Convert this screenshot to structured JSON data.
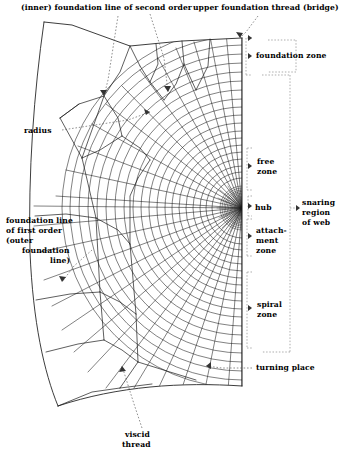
{
  "diagram": {
    "type": "orb-web-anatomy",
    "title_present": false,
    "colors": {
      "ink": "#1a1a1a",
      "leader": "#555555",
      "bracket": "#777777",
      "background": "#ffffff"
    },
    "hub_center": {
      "x": 242,
      "y": 208
    }
  },
  "labels": {
    "inner_foundation": "(inner) foundation line of second order",
    "upper_bridge": "upper foundation thread (bridge)",
    "radius": "radius",
    "outer_foundation_l1": "foundation line",
    "outer_foundation_l2": "of first order",
    "outer_foundation_l3": "(outer",
    "outer_foundation_l4": "foundation",
    "outer_foundation_l5": "line)",
    "turning_place": "turning place",
    "viscid_l1": "viscid",
    "viscid_l2": "thread"
  },
  "zones": {
    "foundation": "foundation zone",
    "free_l1": "free",
    "free_l2": "zone",
    "hub": "hub",
    "attachment_l1": "attach-",
    "attachment_l2": "ment",
    "attachment_l3": "zone",
    "spiral_l1": "spiral",
    "spiral_l2": "zone",
    "snaring_l1": "snaring",
    "snaring_l2": "region",
    "snaring_l3": "of web"
  }
}
